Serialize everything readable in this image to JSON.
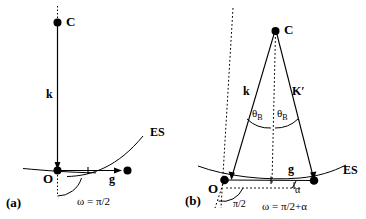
{
  "figure": {
    "background_color": "#ffffff",
    "line_color": "#000000",
    "width": 366,
    "height": 219
  },
  "panels": [
    {
      "id": "a",
      "tag": "(a)",
      "points": [
        {
          "name": "C",
          "label": "C"
        },
        {
          "name": "O",
          "label": "O"
        }
      ],
      "segments": [
        {
          "name": "k-vector",
          "label": "k"
        }
      ],
      "vectors": [
        {
          "name": "g-vector",
          "label": "g"
        }
      ],
      "curves": [
        {
          "name": "ewald-sphere",
          "label": "ES"
        }
      ],
      "angles": [
        {
          "name": "omega-angle",
          "label": "ω = π/2"
        }
      ]
    },
    {
      "id": "b",
      "tag": "(b)",
      "points": [
        {
          "name": "C",
          "label": "C"
        },
        {
          "name": "O",
          "label": "O"
        }
      ],
      "segments": [
        {
          "name": "k-vector",
          "label": "k"
        },
        {
          "name": "k-prime-vector",
          "label": "K′"
        }
      ],
      "vectors": [
        {
          "name": "g-vector",
          "label": "g"
        }
      ],
      "curves": [
        {
          "name": "ewald-sphere",
          "label": "ES"
        }
      ],
      "angles": [
        {
          "name": "theta-b-left",
          "label": "θ",
          "subscript": "B"
        },
        {
          "name": "theta-b-right",
          "label": "θ",
          "subscript": "B"
        },
        {
          "name": "half-pi-angle",
          "label": "π/2"
        },
        {
          "name": "alpha-angle",
          "label": "α"
        },
        {
          "name": "omega-angle",
          "label": "ω = π/2+α"
        }
      ]
    }
  ]
}
